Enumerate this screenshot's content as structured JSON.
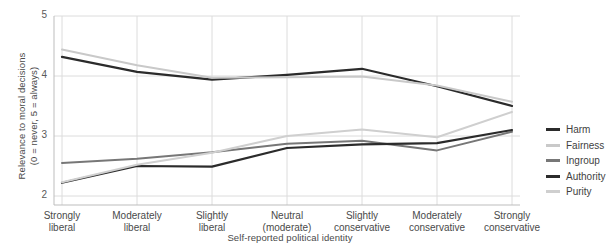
{
  "chart_data": {
    "type": "line",
    "title": "",
    "xlabel": "Self-reported political identity",
    "ylabel": "Relevance to moral decisions (0 = never, 5 = always)",
    "ylabel_line1": "Relevance to moral decisions",
    "ylabel_line2": "(0 = never, 5 = always)",
    "categories": [
      "Strongly liberal",
      "Moderately liberal",
      "Slightly liberal",
      "Neutral (moderate)",
      "Slightly conservative",
      "Moderately conservative",
      "Strongly conservative"
    ],
    "category_lines": [
      [
        "Strongly",
        "liberal"
      ],
      [
        "Moderately",
        "liberal"
      ],
      [
        "Slightly",
        "liberal"
      ],
      [
        "Neutral",
        "(moderate)"
      ],
      [
        "Slightly",
        "conservative"
      ],
      [
        "Moderately",
        "conservative"
      ],
      [
        "Strongly",
        "conservative"
      ]
    ],
    "ylim": [
      2,
      5
    ],
    "yticks": [
      2,
      3,
      4,
      5
    ],
    "ytick_labels": [
      "2",
      "3",
      "4",
      "5"
    ],
    "grid": true,
    "legend_position": "right",
    "series": [
      {
        "name": "Harm",
        "color": "#2b2b2b",
        "width": 2.2,
        "values": [
          4.32,
          4.07,
          3.94,
          4.02,
          4.12,
          3.83,
          3.5
        ]
      },
      {
        "name": "Fairness",
        "color": "#c9c9c9",
        "width": 2.0,
        "values": [
          4.44,
          4.18,
          3.97,
          3.98,
          3.99,
          3.84,
          3.57
        ]
      },
      {
        "name": "Ingroup",
        "color": "#777777",
        "width": 2.0,
        "values": [
          2.55,
          2.62,
          2.73,
          2.87,
          2.92,
          2.76,
          3.07
        ]
      },
      {
        "name": "Authority",
        "color": "#2b2b2b",
        "width": 2.2,
        "values": [
          2.22,
          2.5,
          2.49,
          2.8,
          2.86,
          2.88,
          3.1
        ]
      },
      {
        "name": "Purity",
        "color": "#cfcfcf",
        "width": 2.0,
        "values": [
          2.23,
          2.52,
          2.72,
          3.0,
          3.11,
          2.98,
          3.4
        ]
      }
    ]
  },
  "legend": {
    "items": [
      {
        "label": "Harm"
      },
      {
        "label": "Fairness"
      },
      {
        "label": "Ingroup"
      },
      {
        "label": "Authority"
      },
      {
        "label": "Purity"
      }
    ]
  }
}
